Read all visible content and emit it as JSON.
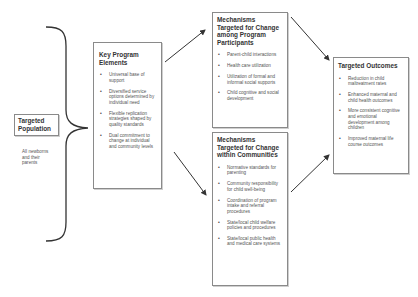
{
  "population": {
    "title_line1": "Targeted",
    "title_line2": "Population",
    "description_line1": "All newborns",
    "description_line2": "and their",
    "description_line3": "parents"
  },
  "key_elements": {
    "title_line1": "Key Program",
    "title_line2": "Elements",
    "items": [
      "Universal base of support",
      "Diversified service options determined by individual need",
      "Flexible replication strategies shaped by quality standards",
      "Dual commitment to change at individual and community levels"
    ]
  },
  "mechanisms_participants": {
    "title_line1": "Mechanisms",
    "title_line2": "Targeted for Change",
    "title_line3": "among Program",
    "title_line4": "Participants",
    "items": [
      "Parent-child interactions",
      "Health care utilization",
      "Utilization of formal and informal social supports",
      "Child cognitive and social development"
    ]
  },
  "mechanisms_communities": {
    "title_line1": "Mechanisms",
    "title_line2": "Targeted for Change",
    "title_line3": "within Communities",
    "items": [
      "Normative standards for parenting",
      "Community responsibility for child well-being",
      "Coordination of program intake and referral procedures",
      "State/local child welfare policies and procedures",
      "State/local public health and medical care systems"
    ]
  },
  "outcomes": {
    "title": "Targeted Outcomes",
    "items": [
      "Reduction in child maltreatment rates",
      "Enhanced maternal and child health outcomes",
      "More consistent cognitive and emotional development among children",
      "Improved maternal life course outcomes"
    ]
  },
  "colors": {
    "border": "#8a8a8a",
    "line": "#333333",
    "text": "#555555"
  }
}
